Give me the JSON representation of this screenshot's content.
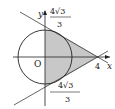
{
  "diagram": {
    "axes": {
      "x_label": "x",
      "y_label": "y",
      "origin_label": "O"
    },
    "labels": {
      "x_intercept": "4",
      "top_num": "4√3",
      "top_den": "3",
      "bottom_num": "4√3",
      "bottom_den": "3"
    },
    "colors": {
      "shade": "#c8c8c8",
      "stroke": "#222222"
    }
  }
}
